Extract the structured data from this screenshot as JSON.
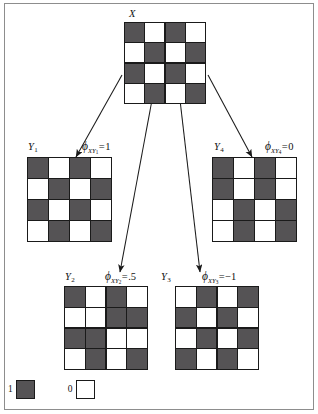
{
  "figure": {
    "colors": {
      "value_1_fill": "#555355",
      "value_0_fill": "#ffffff",
      "stroke": "#1a1a1a",
      "frame": "#8d8d8d"
    },
    "legend": {
      "items": [
        {
          "value": "1",
          "fill": "#555355"
        },
        {
          "value": "0",
          "fill": "#ffffff"
        }
      ]
    },
    "grid_size": 4,
    "panels": [
      {
        "id": "X",
        "name": "X",
        "label_var": "X",
        "label_sub": "",
        "phi": null,
        "matrix": [
          [
            1,
            0,
            1,
            0
          ],
          [
            0,
            1,
            0,
            1
          ],
          [
            1,
            0,
            1,
            0
          ],
          [
            0,
            1,
            0,
            1
          ]
        ]
      },
      {
        "id": "Y1",
        "name": "Y",
        "label_var": "Y",
        "label_sub": "1",
        "phi": {
          "sub_main": "XY",
          "sub_sub": "1",
          "value": "1"
        },
        "matrix": [
          [
            1,
            0,
            1,
            0
          ],
          [
            0,
            1,
            0,
            1
          ],
          [
            1,
            0,
            1,
            0
          ],
          [
            0,
            1,
            0,
            1
          ]
        ]
      },
      {
        "id": "Y4",
        "name": "Y",
        "label_var": "Y",
        "label_sub": "4",
        "phi": {
          "sub_main": "XY",
          "sub_sub": "4",
          "value": "0"
        },
        "matrix": [
          [
            1,
            0,
            1,
            0
          ],
          [
            1,
            0,
            1,
            0
          ],
          [
            0,
            1,
            0,
            1
          ],
          [
            0,
            1,
            0,
            1
          ]
        ]
      },
      {
        "id": "Y2",
        "name": "Y",
        "label_var": "Y",
        "label_sub": "2",
        "phi": {
          "sub_main": "XY",
          "sub_sub": "2",
          "value": ".5"
        },
        "matrix": [
          [
            1,
            0,
            1,
            0
          ],
          [
            0,
            0,
            1,
            1
          ],
          [
            1,
            1,
            0,
            0
          ],
          [
            0,
            1,
            0,
            1
          ]
        ]
      },
      {
        "id": "Y3",
        "name": "Y",
        "label_var": "Y",
        "label_sub": "3",
        "phi": {
          "sub_main": "XY",
          "sub_sub": "3",
          "value": "−1"
        },
        "matrix": [
          [
            0,
            1,
            0,
            1
          ],
          [
            1,
            0,
            1,
            0
          ],
          [
            0,
            1,
            0,
            1
          ],
          [
            1,
            0,
            1,
            0
          ]
        ]
      }
    ]
  }
}
